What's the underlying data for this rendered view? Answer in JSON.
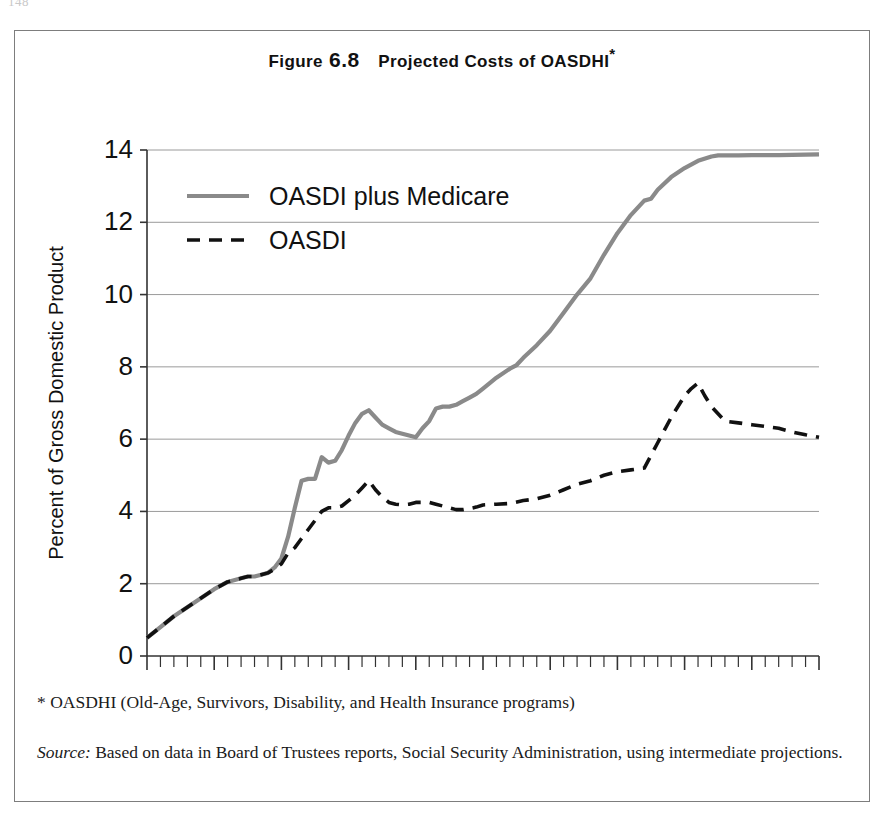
{
  "page": {
    "page_number": "148"
  },
  "figure": {
    "title_prefix": "Figure",
    "title_number": "6.8",
    "title_main": "Projected Costs of OASDHI",
    "title_star": "*",
    "footnote": "* OASDHI (Old-Age, Survivors, Disability, and Health Insurance programs)",
    "source_label": "Source:",
    "source_text": "Based on data in Board of Trustees reports, Social Security Administration, using intermediate projections."
  },
  "colors": {
    "oasdi_plus_medicare": "#8a8a8a",
    "oasdi": "#111111",
    "gridline": "#9a9a9a",
    "axis": "#333333",
    "frame": "#7d7d7d"
  },
  "chart_data": {
    "type": "line",
    "xlabel": "",
    "ylabel": "Percent of Gross Domestic Product",
    "xlim": [
      1950,
      2050
    ],
    "ylim": [
      0,
      14
    ],
    "xticks": [
      1950,
      1960,
      1970,
      1980,
      1990,
      2000,
      2010,
      2020,
      2030,
      2040,
      2050
    ],
    "xtick_labels": [
      "1950",
      "1960",
      "1970",
      "1980",
      "1990",
      "2000",
      "2010",
      "2020",
      "2030",
      "2040",
      "2050"
    ],
    "yticks": [
      0,
      2,
      4,
      6,
      8,
      10,
      12,
      14
    ],
    "ytick_labels": [
      "0",
      "2",
      "4",
      "6",
      "8",
      "10",
      "12",
      "14"
    ],
    "minor_xtick_interval": 2,
    "grid": "horizontal",
    "legend_position": "top-left",
    "series": [
      {
        "name": "OASDI plus Medicare",
        "style": "solid",
        "color": "#8a8a8a",
        "linewidth": 4.2,
        "x": [
          1950,
          1952,
          1954,
          1956,
          1958,
          1960,
          1962,
          1964,
          1965,
          1966,
          1967,
          1968,
          1969,
          1970,
          1971,
          1972,
          1973,
          1974,
          1975,
          1976,
          1977,
          1978,
          1979,
          1980,
          1981,
          1982,
          1983,
          1984,
          1985,
          1986,
          1987,
          1988,
          1989,
          1990,
          1991,
          1992,
          1993,
          1994,
          1995,
          1996,
          1997,
          1998,
          1999,
          2000,
          2002,
          2004,
          2005,
          2006,
          2008,
          2010,
          2012,
          2014,
          2016,
          2018,
          2020,
          2022,
          2024,
          2025,
          2026,
          2028,
          2030,
          2032,
          2034,
          2035,
          2036,
          2038,
          2040,
          2044,
          2048,
          2050
        ],
        "y": [
          0.5,
          0.8,
          1.1,
          1.35,
          1.6,
          1.85,
          2.05,
          2.15,
          2.2,
          2.2,
          2.25,
          2.3,
          2.45,
          2.7,
          3.3,
          4.1,
          4.85,
          4.9,
          4.9,
          5.5,
          5.35,
          5.4,
          5.7,
          6.1,
          6.45,
          6.7,
          6.8,
          6.6,
          6.4,
          6.3,
          6.2,
          6.15,
          6.1,
          6.05,
          6.3,
          6.5,
          6.85,
          6.9,
          6.9,
          6.95,
          7.05,
          7.15,
          7.25,
          7.4,
          7.7,
          7.95,
          8.05,
          8.25,
          8.6,
          9.0,
          9.5,
          10.0,
          10.45,
          11.1,
          11.7,
          12.2,
          12.6,
          12.65,
          12.9,
          13.25,
          13.5,
          13.7,
          13.82,
          13.85,
          13.85,
          13.85,
          13.86,
          13.86,
          13.87,
          13.88
        ]
      },
      {
        "name": "OASDI",
        "style": "dashed",
        "color": "#111111",
        "linewidth": 3.6,
        "x": [
          1950,
          1952,
          1954,
          1956,
          1958,
          1960,
          1962,
          1964,
          1965,
          1966,
          1967,
          1968,
          1969,
          1970,
          1971,
          1972,
          1973,
          1974,
          1975,
          1976,
          1977,
          1978,
          1979,
          1980,
          1981,
          1982,
          1983,
          1984,
          1985,
          1986,
          1987,
          1988,
          1989,
          1990,
          1991,
          1992,
          1993,
          1994,
          1995,
          1996,
          1997,
          1998,
          1999,
          2000,
          2002,
          2004,
          2006,
          2008,
          2010,
          2012,
          2014,
          2016,
          2018,
          2020,
          2022,
          2024,
          2026,
          2028,
          2030,
          2031,
          2032,
          2033,
          2034,
          2036,
          2038,
          2040,
          2042,
          2044,
          2046,
          2048,
          2050
        ],
        "y": [
          0.5,
          0.8,
          1.1,
          1.35,
          1.6,
          1.85,
          2.05,
          2.15,
          2.2,
          2.2,
          2.25,
          2.3,
          2.4,
          2.55,
          2.85,
          3.0,
          3.25,
          3.5,
          3.75,
          4.0,
          4.1,
          4.1,
          4.15,
          4.3,
          4.45,
          4.65,
          4.85,
          4.6,
          4.4,
          4.25,
          4.2,
          4.18,
          4.2,
          4.25,
          4.25,
          4.25,
          4.2,
          4.15,
          4.1,
          4.05,
          4.05,
          4.08,
          4.12,
          4.18,
          4.2,
          4.22,
          4.3,
          4.35,
          4.45,
          4.6,
          4.75,
          4.85,
          5.0,
          5.1,
          5.15,
          5.2,
          5.9,
          6.6,
          7.2,
          7.4,
          7.55,
          7.2,
          6.9,
          6.5,
          6.45,
          6.4,
          6.35,
          6.3,
          6.2,
          6.12,
          6.05
        ]
      }
    ]
  }
}
